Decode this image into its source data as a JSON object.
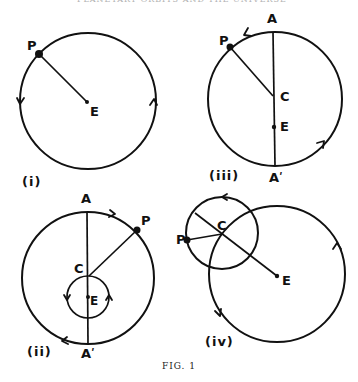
{
  "header": {
    "running_title": "PLANETARY ORBITS AND THE UNIVERSE"
  },
  "caption": "FIG. 1",
  "panels": [
    {
      "id": "i",
      "label": "(i)",
      "points": {
        "P": "P",
        "E": "E"
      }
    },
    {
      "id": "iii",
      "label": "(iii)",
      "points": {
        "A": "A",
        "P": "P",
        "C": "C",
        "E": "E",
        "A_prime": "Aʹ"
      }
    },
    {
      "id": "ii",
      "label": "(ii)",
      "points": {
        "A": "A",
        "P": "P",
        "C": "C",
        "E": "E",
        "A_prime": "Aʹ"
      }
    },
    {
      "id": "iv",
      "label": "(iv)",
      "points": {
        "P": "P",
        "C": "C",
        "E": "E"
      }
    }
  ],
  "colors": {
    "ink": "#111111",
    "background": "#ffffff"
  }
}
